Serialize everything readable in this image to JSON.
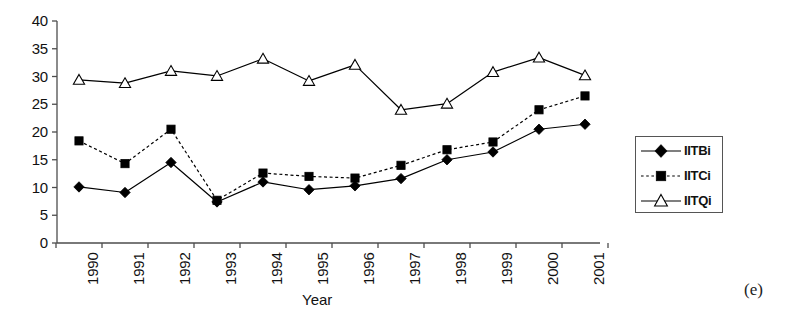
{
  "figure": {
    "caption": "(e)"
  },
  "chart_data": {
    "type": "line",
    "title": "",
    "xlabel": "Year",
    "ylabel": "",
    "categories": [
      "1990",
      "1991",
      "1992",
      "1993",
      "1994",
      "1995",
      "1996",
      "1997",
      "1998",
      "1999",
      "2000",
      "2001"
    ],
    "x": [
      1990,
      1991,
      1992,
      1993,
      1994,
      1995,
      1996,
      1997,
      1998,
      1999,
      2000,
      2001
    ],
    "ylim": [
      0,
      40
    ],
    "yticks": [
      0,
      5,
      10,
      15,
      20,
      25,
      30,
      35,
      40
    ],
    "ytick_labels": [
      "0",
      "5",
      "10",
      "15",
      "20",
      "25",
      "30",
      "35",
      "40"
    ],
    "grid": false,
    "legend_position": "right",
    "series": [
      {
        "name": "IITBi",
        "marker": "filled-diamond",
        "line_style": "solid",
        "color": "#000000",
        "values": [
          10.1,
          9.1,
          14.5,
          7.4,
          11.0,
          9.6,
          10.3,
          11.6,
          15.0,
          16.4,
          20.5,
          21.4
        ]
      },
      {
        "name": "IITCi",
        "marker": "filled-square",
        "line_style": "dotted",
        "color": "#000000",
        "values": [
          18.4,
          14.3,
          20.5,
          7.7,
          12.6,
          12.0,
          11.7,
          14.0,
          16.8,
          18.2,
          24.0,
          26.5
        ]
      },
      {
        "name": "IITQi",
        "marker": "open-triangle",
        "line_style": "solid",
        "color": "#000000",
        "values": [
          29.4,
          28.8,
          31.0,
          30.1,
          33.2,
          29.2,
          32.1,
          24.0,
          25.1,
          30.8,
          33.4,
          30.2
        ]
      }
    ]
  },
  "legend": {
    "entries": [
      {
        "label": "IITBi"
      },
      {
        "label": "IITCi"
      },
      {
        "label": "IITQi"
      }
    ]
  },
  "axes": {
    "x_title": "Year"
  }
}
